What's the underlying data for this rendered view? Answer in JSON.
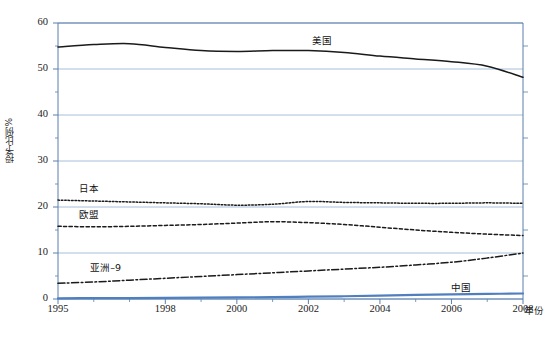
{
  "chart_data": {
    "type": "line",
    "title": "",
    "xlabel": "年份",
    "ylabel": "授予比例%",
    "xlim": [
      1995,
      2008
    ],
    "ylim": [
      0,
      60
    ],
    "grid": true,
    "legend_position": "inline-annotations",
    "x": [
      1995,
      1996,
      1997,
      1998,
      1999,
      2000,
      2001,
      2002,
      2003,
      2004,
      2005,
      2006,
      2007,
      2008
    ],
    "xtick_labels": [
      "1995",
      "1998",
      "2000",
      "2002",
      "2004",
      "2006",
      "2008"
    ],
    "xticks": [
      1995,
      1998,
      2000,
      2002,
      2004,
      2006,
      2008
    ],
    "ytick_labels": [
      "0",
      "10",
      "20",
      "30",
      "40",
      "50",
      "60"
    ],
    "yticks": [
      0,
      10,
      20,
      30,
      40,
      50,
      60
    ],
    "yminor_ticks": [
      5,
      15,
      25,
      35,
      45,
      55
    ],
    "series": [
      {
        "name": "美国",
        "label": "美国",
        "style": "solid",
        "color": "#1a1a1a",
        "values": [
          54.8,
          55.3,
          55.5,
          54.7,
          54.0,
          53.8,
          54.0,
          54.0,
          53.6,
          52.8,
          52.2,
          51.6,
          50.6,
          48.2
        ]
      },
      {
        "name": "日本",
        "label": "日本",
        "style": "dotted",
        "color": "#1a1a1a",
        "values": [
          21.5,
          21.3,
          21.1,
          20.9,
          20.7,
          20.4,
          20.6,
          21.2,
          21.0,
          20.9,
          20.8,
          20.8,
          20.9,
          20.8
        ]
      },
      {
        "name": "欧盟",
        "label": "欧盟",
        "style": "dashed",
        "color": "#1a1a1a",
        "values": [
          15.8,
          15.7,
          15.8,
          16.0,
          16.2,
          16.5,
          16.8,
          16.6,
          16.2,
          15.6,
          15.0,
          14.5,
          14.1,
          13.8
        ]
      },
      {
        "name": "亚洲-9",
        "label": "亚洲–9",
        "style": "dashdot",
        "color": "#1a1a1a",
        "values": [
          3.4,
          3.7,
          4.1,
          4.5,
          4.9,
          5.3,
          5.7,
          6.1,
          6.5,
          6.9,
          7.4,
          8.0,
          8.9,
          10.0
        ]
      },
      {
        "name": "中国",
        "label": "中国",
        "style": "solid-blue",
        "color": "#4f7fbf",
        "values": [
          0.15,
          0.18,
          0.2,
          0.25,
          0.3,
          0.35,
          0.4,
          0.5,
          0.6,
          0.75,
          0.9,
          1.0,
          1.1,
          1.2
        ]
      }
    ],
    "annotations": [
      {
        "text": "美国",
        "x": 2002.1,
        "y": 56.2
      },
      {
        "text": "日本",
        "x": 1995.6,
        "y": 24.2
      },
      {
        "text": "欧盟",
        "x": 1995.6,
        "y": 18.5
      },
      {
        "text": "亚洲–9",
        "x": 1995.9,
        "y": 6.9
      },
      {
        "text": "中国",
        "x": 2006.0,
        "y": 2.7
      }
    ],
    "colors": {
      "gridline": "#9bb7d4",
      "axis": "#5a7fae",
      "series_dark": "#1a1a1a",
      "china_blue": "#4f7fbf"
    }
  }
}
